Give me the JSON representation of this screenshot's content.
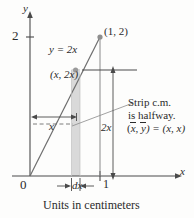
{
  "figure": {
    "caption": "Units in centimeters",
    "axes": {
      "x_label": "x",
      "y_label": "y",
      "origin_label": "0",
      "x_ticks": [
        "1"
      ],
      "y_ticks": [
        "2"
      ]
    },
    "curve": {
      "equation_label": "y = 2x",
      "slope": 2,
      "x_range": [
        0,
        1
      ]
    },
    "points": [
      {
        "name": "apex",
        "label": "(1, 2)",
        "x": 1,
        "y": 2
      },
      {
        "name": "strip-top",
        "label": "(x, 2x)",
        "x": 0.5,
        "y": 1
      }
    ],
    "dimensions": [
      {
        "name": "horizontal-x",
        "label": "x"
      },
      {
        "name": "vertical-2x",
        "label": "2x"
      },
      {
        "name": "strip-width",
        "label": "dx"
      }
    ],
    "annotation": {
      "line1": "Strip c.m.",
      "line2": "is halfway.",
      "formula_open": "(",
      "formula_xbar": "x",
      "formula_comma": ", ",
      "formula_ybar": "y",
      "formula_rest": ") = (x, x)"
    },
    "colors": {
      "ink": "#2b2b2b",
      "strip_fill": "#d9d9d9",
      "background": "#fdfdfc"
    }
  }
}
